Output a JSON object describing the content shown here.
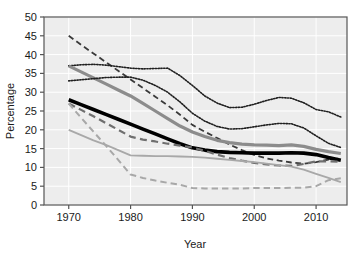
{
  "chart_data": {
    "type": "line",
    "title": "",
    "xlabel": "Year",
    "ylabel": "Percentage",
    "xlim": [
      1966,
      2015
    ],
    "ylim": [
      0,
      50
    ],
    "xticks": [
      1970,
      1980,
      1990,
      2000,
      2010
    ],
    "yticks": [
      0,
      5,
      10,
      15,
      20,
      25,
      30,
      35,
      40,
      45,
      50
    ],
    "grid": true,
    "legend": "none",
    "plot_background": "#ededed",
    "x": [
      1970,
      1972,
      1974,
      1976,
      1978,
      1980,
      1982,
      1984,
      1986,
      1988,
      1990,
      1992,
      1994,
      1996,
      1998,
      2000,
      2002,
      2004,
      2006,
      2008,
      2010,
      2012,
      2014
    ],
    "series": [
      {
        "name": "dark-dashed-upper",
        "style": "dashed",
        "color": "#3a3a3a",
        "width": 1.8,
        "values": [
          45.0,
          42.6,
          40.3,
          38.0,
          35.7,
          33.4,
          31.1,
          28.8,
          26.5,
          24.0,
          21.3,
          19.5,
          17.8,
          16.1,
          14.6,
          13.3,
          12.4,
          11.8,
          11.3,
          11.0,
          11.4,
          12.1,
          12.4
        ]
      },
      {
        "name": "dotted-upper",
        "style": "dotted",
        "color": "#1f1f1f",
        "width": 1.6,
        "values": [
          37.0,
          37.3,
          37.4,
          37.2,
          36.8,
          36.4,
          36.2,
          36.3,
          36.4,
          34.4,
          31.8,
          29.0,
          27.1,
          25.9,
          26.0,
          26.8,
          27.8,
          28.6,
          28.4,
          27.2,
          25.4,
          24.8,
          23.4
        ]
      },
      {
        "name": "gray-solid-thick",
        "style": "solid",
        "color": "#8c8c8c",
        "width": 3.2,
        "values": [
          37.0,
          35.4,
          33.8,
          32.2,
          30.6,
          29.0,
          27.0,
          25.0,
          23.0,
          21.0,
          19.4,
          18.2,
          17.2,
          16.6,
          16.2,
          16.0,
          15.9,
          15.8,
          16.0,
          15.6,
          14.8,
          14.2,
          13.7
        ]
      },
      {
        "name": "dotted-lower",
        "style": "dotted",
        "color": "#1f1f1f",
        "width": 1.6,
        "values": [
          33.0,
          33.3,
          33.6,
          33.9,
          34.0,
          34.0,
          33.2,
          31.8,
          30.0,
          27.4,
          24.4,
          22.3,
          20.9,
          20.2,
          20.3,
          20.8,
          21.3,
          21.7,
          21.6,
          20.5,
          18.4,
          16.4,
          15.3
        ]
      },
      {
        "name": "black-solid-thick",
        "style": "solid",
        "color": "#000000",
        "width": 3.6,
        "values": [
          28.0,
          26.7,
          25.4,
          24.1,
          22.8,
          21.5,
          20.2,
          18.9,
          17.6,
          16.3,
          15.2,
          14.6,
          14.2,
          14.0,
          13.9,
          13.8,
          13.8,
          13.8,
          13.9,
          13.8,
          13.4,
          12.6,
          11.9
        ]
      },
      {
        "name": "gray-dashed-mid",
        "style": "dashed",
        "color": "#6f6f6f",
        "width": 2.2,
        "values": [
          27.0,
          25.3,
          23.6,
          21.8,
          20.0,
          18.2,
          17.4,
          16.9,
          16.3,
          15.8,
          15.3,
          14.4,
          13.4,
          12.5,
          11.8,
          11.2,
          10.8,
          10.5,
          10.4,
          10.9,
          11.6,
          11.6,
          11.5
        ]
      },
      {
        "name": "light-gray-solid",
        "style": "solid",
        "color": "#a8a8a8",
        "width": 1.8,
        "values": [
          20.0,
          18.6,
          17.2,
          16.0,
          14.6,
          13.2,
          13.1,
          13.0,
          13.0,
          12.9,
          12.8,
          12.6,
          12.3,
          12.0,
          11.7,
          11.4,
          11.0,
          10.6,
          10.2,
          9.4,
          8.3,
          7.2,
          6.1
        ]
      },
      {
        "name": "light-gray-dashed-lower",
        "style": "dashed",
        "color": "#a8a8a8",
        "width": 2.0,
        "values": [
          27.0,
          23.2,
          19.5,
          15.8,
          12.0,
          8.1,
          7.2,
          6.5,
          5.9,
          5.4,
          4.5,
          4.4,
          4.4,
          4.4,
          4.4,
          4.5,
          4.5,
          4.5,
          4.6,
          4.6,
          5.0,
          6.6,
          7.1
        ]
      }
    ]
  }
}
